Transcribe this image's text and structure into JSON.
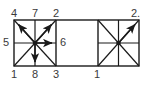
{
  "figure": {
    "kind": "vector-arrow-diagram",
    "background_color": "#ffffff",
    "stroke_color": "#1a1a1a",
    "label_color": "#3a3a3a",
    "clipped_caption_text": "cut off caption text",
    "cells": [
      {
        "name": "left-cell",
        "x": 14,
        "y": 20,
        "width": 42,
        "height": 46,
        "has_cross": true,
        "has_diagonals": true,
        "arrows": [
          "up-left",
          "up-right",
          "right",
          "down"
        ],
        "plain_spokes": [
          "left",
          "down-left",
          "down-right",
          "up"
        ]
      },
      {
        "name": "middle-cell",
        "x": 56,
        "y": 20,
        "width": 42,
        "height": 46,
        "has_cross": false,
        "has_diagonals": false,
        "arrows": [],
        "plain_spokes": []
      },
      {
        "name": "right-cell",
        "x": 98,
        "y": 20,
        "width": 41,
        "height": 46,
        "has_cross": true,
        "has_diagonals": true,
        "arrows": [
          "up-right"
        ],
        "plain_spokes": [
          "up-left",
          "down-left",
          "down-right"
        ]
      }
    ],
    "labels": {
      "top": [
        {
          "text": "4",
          "x": 11,
          "y": 8
        },
        {
          "text": "7",
          "x": 32,
          "y": 8
        },
        {
          "text": "2",
          "x": 53,
          "y": 8
        },
        {
          "text": "2.",
          "x": 131,
          "y": 8
        }
      ],
      "left": [
        {
          "text": "5",
          "x": 3,
          "y": 37
        }
      ],
      "inner": [
        {
          "text": "6",
          "x": 60,
          "y": 37
        }
      ],
      "bottom": [
        {
          "text": "1",
          "x": 11,
          "y": 69
        },
        {
          "text": "8",
          "x": 32,
          "y": 69
        },
        {
          "text": "3",
          "x": 53,
          "y": 69
        },
        {
          "text": "1",
          "x": 94,
          "y": 69
        }
      ]
    }
  }
}
